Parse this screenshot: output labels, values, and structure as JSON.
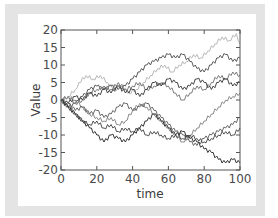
{
  "chart_data": {
    "type": "line",
    "title": "",
    "xlabel": "time",
    "ylabel": "Value",
    "xlim": [
      0,
      100
    ],
    "ylim": [
      -20,
      20
    ],
    "grid": false,
    "legend": null,
    "x_ticks": [
      0,
      20,
      40,
      60,
      80,
      100
    ],
    "y_ticks": [
      20,
      15,
      10,
      5,
      0,
      -5,
      -10,
      -15,
      -20
    ],
    "x_tick_labels": [
      "0",
      "20",
      "40",
      "60",
      "80",
      "100"
    ],
    "y_tick_labels": [
      "20",
      "15",
      "10",
      "5",
      "0",
      "-5",
      "-10",
      "-15",
      "-20"
    ],
    "series": [
      {
        "name": "walk-1",
        "color": "#b8b8b8",
        "x": [
          0,
          4,
          8,
          10,
          14,
          18,
          22,
          26,
          30,
          34,
          38,
          42,
          46,
          50,
          54,
          58,
          62,
          66,
          70,
          74,
          78,
          82,
          86,
          90,
          94,
          98,
          100
        ],
        "values": [
          0,
          1,
          3,
          5,
          7,
          6,
          7,
          5,
          3,
          4,
          2,
          3,
          5,
          7,
          9,
          10,
          8,
          10,
          11,
          13,
          12,
          14,
          16,
          18,
          17,
          19,
          16
        ]
      },
      {
        "name": "walk-2",
        "color": "#5a5a5a",
        "x": [
          0,
          4,
          8,
          12,
          16,
          20,
          24,
          28,
          32,
          36,
          40,
          44,
          48,
          52,
          56,
          60,
          64,
          68,
          72,
          76,
          80,
          84,
          88,
          92,
          96,
          100
        ],
        "values": [
          0,
          -2,
          -1,
          1,
          3,
          4,
          3,
          4,
          3,
          4,
          6,
          8,
          10,
          11,
          12,
          13,
          12,
          13,
          11,
          9,
          8,
          10,
          12,
          13,
          11,
          12
        ]
      },
      {
        "name": "walk-3",
        "color": "#7a7a7a",
        "x": [
          0,
          4,
          8,
          12,
          16,
          20,
          24,
          28,
          32,
          36,
          40,
          44,
          48,
          52,
          56,
          60,
          64,
          68,
          72,
          76,
          80,
          84,
          88,
          92,
          96,
          100
        ],
        "values": [
          0,
          1,
          -1,
          0,
          2,
          3,
          4,
          3,
          5,
          3,
          4,
          5,
          3,
          4,
          5,
          4,
          2,
          0,
          2,
          4,
          3,
          5,
          7,
          6,
          8,
          7
        ]
      },
      {
        "name": "walk-4",
        "color": "#444444",
        "x": [
          0,
          4,
          8,
          12,
          16,
          20,
          24,
          28,
          32,
          36,
          40,
          44,
          48,
          52,
          56,
          60,
          64,
          68,
          72,
          76,
          80,
          84,
          88,
          92,
          96,
          100
        ],
        "values": [
          0,
          -1,
          1,
          0,
          2,
          1,
          3,
          2,
          4,
          2,
          3,
          1,
          3,
          5,
          4,
          6,
          5,
          3,
          4,
          6,
          5,
          3,
          5,
          6,
          4,
          5
        ]
      },
      {
        "name": "walk-5",
        "color": "#8a8a8a",
        "x": [
          0,
          4,
          8,
          12,
          16,
          20,
          24,
          28,
          32,
          36,
          40,
          44,
          48,
          52,
          56,
          60,
          64,
          68,
          72,
          76,
          80,
          84,
          88,
          92,
          96,
          100
        ],
        "values": [
          0,
          1,
          0,
          -2,
          -4,
          -5,
          -6,
          -5,
          -7,
          -6,
          -3,
          -1,
          -2,
          -4,
          -6,
          -8,
          -10,
          -12,
          -10,
          -8,
          -6,
          -4,
          -2,
          0,
          1,
          2
        ]
      },
      {
        "name": "walk-6",
        "color": "#666666",
        "x": [
          0,
          4,
          8,
          12,
          16,
          20,
          24,
          28,
          32,
          36,
          40,
          44,
          48,
          52,
          56,
          60,
          64,
          68,
          72,
          76,
          80,
          84,
          88,
          92,
          96,
          100
        ],
        "values": [
          0,
          -1,
          -3,
          -2,
          -4,
          -3,
          -5,
          -4,
          -2,
          -1,
          -3,
          -2,
          -1,
          -3,
          -5,
          -7,
          -9,
          -10,
          -12,
          -13,
          -11,
          -10,
          -9,
          -8,
          -7,
          -5
        ]
      },
      {
        "name": "walk-7",
        "color": "#505050",
        "x": [
          0,
          4,
          8,
          12,
          16,
          20,
          24,
          28,
          32,
          36,
          40,
          44,
          48,
          52,
          56,
          60,
          64,
          68,
          72,
          76,
          80,
          84,
          88,
          92,
          96,
          100
        ],
        "values": [
          0,
          -2,
          -4,
          -6,
          -7,
          -6,
          -8,
          -7,
          -9,
          -8,
          -9,
          -8,
          -10,
          -9,
          -10,
          -11,
          -10,
          -11,
          -10,
          -11,
          -12,
          -11,
          -10,
          -9,
          -10,
          -8
        ]
      },
      {
        "name": "walk-8",
        "color": "#353535",
        "x": [
          0,
          4,
          8,
          12,
          16,
          20,
          24,
          28,
          32,
          36,
          40,
          44,
          48,
          52,
          56,
          60,
          64,
          68,
          72,
          76,
          80,
          84,
          88,
          92,
          96,
          100
        ],
        "values": [
          0,
          -2,
          -4,
          -6,
          -8,
          -10,
          -12,
          -10,
          -11,
          -12,
          -10,
          -8,
          -6,
          -4,
          -6,
          -8,
          -10,
          -9,
          -11,
          -12,
          -14,
          -15,
          -17,
          -18,
          -17,
          -18
        ]
      }
    ]
  }
}
